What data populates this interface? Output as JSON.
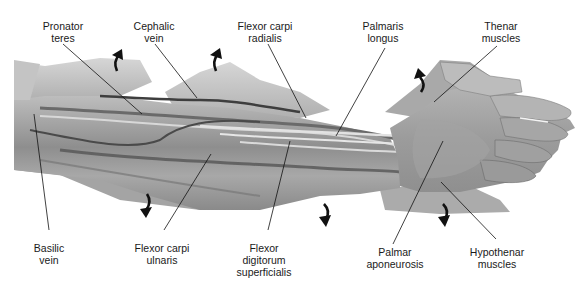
{
  "figure": {
    "colors": {
      "background": "#ffffff",
      "text": "#1a1a1a",
      "leader_line": "#111111",
      "arrow": "#111111",
      "tissue_light": "#c9c9c9",
      "tissue_mid": "#9a9a9a",
      "tissue_dark": "#5a5a5a"
    },
    "labels_top": [
      {
        "id": "pronator-teres",
        "lines": [
          "Pronator",
          "teres"
        ]
      },
      {
        "id": "cephalic-vein",
        "lines": [
          "Cephalic",
          "vein"
        ]
      },
      {
        "id": "flexor-carpi-radialis",
        "lines": [
          "Flexor carpi",
          "radialis"
        ]
      },
      {
        "id": "palmaris-longus",
        "lines": [
          "Palmaris",
          "longus"
        ]
      },
      {
        "id": "thenar-muscles",
        "lines": [
          "Thenar",
          "muscles"
        ]
      }
    ],
    "labels_bottom": [
      {
        "id": "basilic-vein",
        "lines": [
          "Basilic",
          "vein"
        ]
      },
      {
        "id": "flexor-carpi-ulnaris",
        "lines": [
          "Flexor carpi",
          "ulnaris"
        ]
      },
      {
        "id": "flexor-digitorum-superficialis",
        "lines": [
          "Flexor",
          "digitorum",
          "superficialis"
        ]
      },
      {
        "id": "palmar-aponeurosis",
        "lines": [
          "Palmar",
          "aponeurosis"
        ]
      },
      {
        "id": "hypothenar-muscles",
        "lines": [
          "Hypothenar",
          "muscles"
        ]
      }
    ],
    "retraction_arrows": {
      "up_count": 3,
      "down_count": 3
    }
  }
}
